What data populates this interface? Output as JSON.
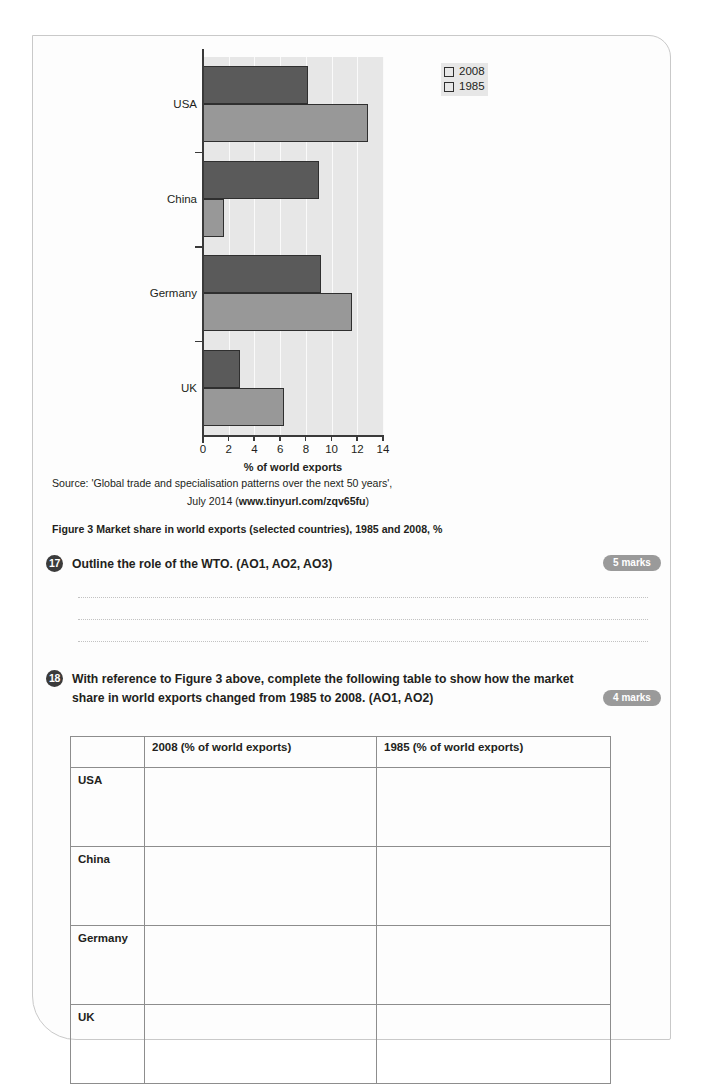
{
  "chart_data": {
    "type": "bar",
    "orientation": "horizontal",
    "title": "",
    "xlabel": "% of world exports",
    "ylabel": "",
    "xlim": [
      0,
      14
    ],
    "xticks": [
      0,
      2,
      4,
      6,
      8,
      10,
      12,
      14
    ],
    "grid": true,
    "legend_position": "top-right",
    "categories": [
      "USA",
      "China",
      "Germany",
      "UK"
    ],
    "series": [
      {
        "name": "2008",
        "color": "#5a5a5a",
        "values": [
          8.2,
          9.0,
          9.2,
          2.9
        ]
      },
      {
        "name": "1985",
        "color": "#989898",
        "values": [
          12.8,
          1.6,
          11.6,
          6.3
        ]
      }
    ]
  },
  "figure": {
    "source_line_1": "Source: 'Global trade and specialisation patterns over the next 50 years',",
    "source_line_2_prefix": "July 2014 (",
    "source_line_2_url": "www.tinyurl.com/zqv65fu",
    "source_line_2_suffix": ")",
    "caption": "Figure 3 Market share in world exports (selected countries), 1985 and 2008, %"
  },
  "questions": [
    {
      "number": "17",
      "text": "Outline the role of the WTO. (AO1, AO2, AO3)",
      "marks": "5 marks",
      "answer_line_count": 3
    },
    {
      "number": "18",
      "text": "With reference to Figure 3 above, complete the following table to show how the market share in world exports changed from 1985 to 2008. (AO1, AO2)",
      "marks": "4 marks"
    }
  ],
  "answer_table": {
    "headers": [
      "",
      "2008 (% of world exports)",
      "1985 (% of world exports)"
    ],
    "rows": [
      {
        "label": "USA",
        "cells": [
          "",
          ""
        ]
      },
      {
        "label": "China",
        "cells": [
          "",
          ""
        ]
      },
      {
        "label": "Germany",
        "cells": [
          "",
          ""
        ]
      },
      {
        "label": "UK",
        "cells": [
          "",
          ""
        ]
      }
    ]
  },
  "colors": {
    "series_2008": "#5a5a5a",
    "series_1985": "#989898",
    "plot_background": "#e7e7e7",
    "marks_badge": "#9a9a9a",
    "question_number_badge": "#3b3b3b"
  }
}
